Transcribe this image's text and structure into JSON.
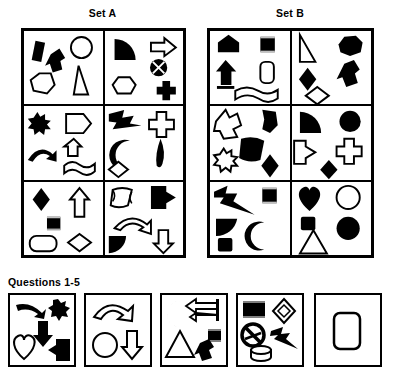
{
  "page": {
    "background": "#ffffff",
    "ink": "#000000",
    "fill_black": "#000000",
    "fill_white": "#ffffff"
  },
  "headings": {
    "set_a_label": "Set A",
    "set_b_label": "Set B",
    "questions_label": "Questions 1-5"
  },
  "sets": [
    {
      "name": "Set A",
      "cells": [
        {
          "index": 1,
          "shapes": [
            {
              "name": "rectangle-tilted",
              "fill": "black"
            },
            {
              "name": "up-arrow",
              "fill": "black"
            },
            {
              "name": "circle",
              "fill": "white"
            },
            {
              "name": "pentagon",
              "fill": "white"
            },
            {
              "name": "right-triangle",
              "fill": "white"
            }
          ]
        },
        {
          "index": 2,
          "shapes": [
            {
              "name": "quarter-pie",
              "fill": "black"
            },
            {
              "name": "right-arrow",
              "fill": "white"
            },
            {
              "name": "circle-with-x",
              "fill": "black"
            },
            {
              "name": "hexagon",
              "fill": "white"
            },
            {
              "name": "cross",
              "fill": "black"
            }
          ]
        },
        {
          "index": 3,
          "shapes": [
            {
              "name": "starburst",
              "fill": "black"
            },
            {
              "name": "pentagon-wide",
              "fill": "white"
            },
            {
              "name": "curved-arrow",
              "fill": "black"
            },
            {
              "name": "arrow-block-up",
              "fill": "white"
            },
            {
              "name": "wavy-ribbon",
              "fill": "white"
            }
          ]
        },
        {
          "index": 4,
          "shapes": [
            {
              "name": "lightning-feather",
              "fill": "black"
            },
            {
              "name": "cross",
              "fill": "white"
            },
            {
              "name": "crescent",
              "fill": "black"
            },
            {
              "name": "teardrop",
              "fill": "black"
            },
            {
              "name": "small-diamond",
              "fill": "white"
            }
          ]
        },
        {
          "index": 5,
          "shapes": [
            {
              "name": "diamond",
              "fill": "black"
            },
            {
              "name": "up-arrow-outline",
              "fill": "white"
            },
            {
              "name": "small-square",
              "fill": "black"
            },
            {
              "name": "rounded-rectangle",
              "fill": "white"
            },
            {
              "name": "small-diamond",
              "fill": "white"
            }
          ]
        },
        {
          "index": 6,
          "shapes": [
            {
              "name": "scroll",
              "fill": "white"
            },
            {
              "name": "flag-arrow-right",
              "fill": "black"
            },
            {
              "name": "curved-arrow",
              "fill": "white"
            },
            {
              "name": "quarter-pie",
              "fill": "black"
            },
            {
              "name": "down-arrow",
              "fill": "white"
            }
          ]
        }
      ]
    },
    {
      "name": "Set B",
      "cells": [
        {
          "index": 1,
          "shapes": [
            {
              "name": "house-pentagon",
              "fill": "black"
            },
            {
              "name": "small-square",
              "fill": "black"
            },
            {
              "name": "up-arrow",
              "fill": "black"
            },
            {
              "name": "rounded-rectangle",
              "fill": "white"
            },
            {
              "name": "wavy-ribbon",
              "fill": "white"
            }
          ]
        },
        {
          "index": 2,
          "shapes": [
            {
              "name": "right-triangle",
              "fill": "white"
            },
            {
              "name": "hexagon-blob",
              "fill": "black"
            },
            {
              "name": "up-arrow",
              "fill": "black"
            },
            {
              "name": "diamond",
              "fill": "black"
            },
            {
              "name": "small-diamond",
              "fill": "white"
            }
          ]
        },
        {
          "index": 3,
          "shapes": [
            {
              "name": "diagonal-arrow",
              "fill": "white"
            },
            {
              "name": "blob-pentagon",
              "fill": "black"
            },
            {
              "name": "scroll",
              "fill": "black"
            },
            {
              "name": "starburst",
              "fill": "white"
            },
            {
              "name": "diamond",
              "fill": "black"
            }
          ]
        },
        {
          "index": 4,
          "shapes": [
            {
              "name": "quarter-pie",
              "fill": "black"
            },
            {
              "name": "circle",
              "fill": "black"
            },
            {
              "name": "flag-arrow-right",
              "fill": "white"
            },
            {
              "name": "cross",
              "fill": "white"
            },
            {
              "name": "diamond",
              "fill": "black"
            }
          ]
        },
        {
          "index": 5,
          "shapes": [
            {
              "name": "lightning-feather",
              "fill": "black"
            },
            {
              "name": "small-square",
              "fill": "black"
            },
            {
              "name": "quarter-pie",
              "fill": "black"
            },
            {
              "name": "crescent",
              "fill": "black"
            },
            {
              "name": "small-square",
              "fill": "black"
            }
          ]
        },
        {
          "index": 6,
          "shapes": [
            {
              "name": "heart",
              "fill": "black"
            },
            {
              "name": "circle",
              "fill": "white"
            },
            {
              "name": "small-square",
              "fill": "black"
            },
            {
              "name": "circle",
              "fill": "black"
            },
            {
              "name": "triangle",
              "fill": "white"
            }
          ]
        }
      ]
    }
  ],
  "questions": [
    {
      "number": 1,
      "shapes": [
        {
          "name": "curved-arrow",
          "fill": "black"
        },
        {
          "name": "starburst",
          "fill": "black"
        },
        {
          "name": "down-arrow",
          "fill": "black"
        },
        {
          "name": "heart",
          "fill": "white"
        },
        {
          "name": "flag-arrow-left",
          "fill": "black"
        }
      ]
    },
    {
      "number": 2,
      "shapes": [
        {
          "name": "curved-arrow",
          "fill": "white"
        },
        {
          "name": "circle",
          "fill": "white"
        },
        {
          "name": "down-arrow",
          "fill": "white"
        }
      ]
    },
    {
      "number": 3,
      "shapes": [
        {
          "name": "crescent",
          "fill": "black"
        },
        {
          "name": "left-arrow",
          "fill": "white"
        },
        {
          "name": "triangle",
          "fill": "white"
        },
        {
          "name": "small-square",
          "fill": "black"
        },
        {
          "name": "up-arrow",
          "fill": "black"
        }
      ]
    },
    {
      "number": 4,
      "shapes": [
        {
          "name": "square",
          "fill": "black"
        },
        {
          "name": "diamond-outline-nested",
          "fill": "white"
        },
        {
          "name": "circle-with-slash",
          "fill": "black"
        },
        {
          "name": "lightning-feather",
          "fill": "black"
        },
        {
          "name": "cylinder",
          "fill": "white"
        }
      ]
    },
    {
      "number": 5,
      "shapes": [
        {
          "name": "rounded-rectangle",
          "fill": "white"
        }
      ]
    }
  ]
}
